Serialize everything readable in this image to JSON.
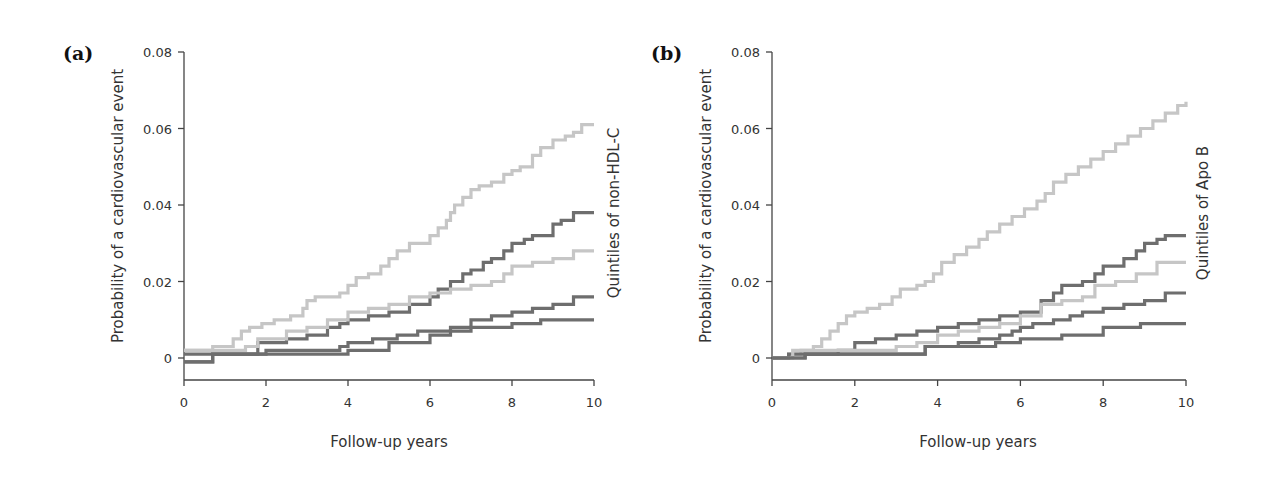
{
  "chart_data": [
    {
      "panel": "(a)",
      "type": "line",
      "step": true,
      "title": "",
      "xlabel": "Follow-up years",
      "ylabel": "Probability of a cardiovascular event",
      "legend_label": "Quintiles of non-HDL-C",
      "xlim": [
        0,
        10
      ],
      "ylim": [
        0,
        0.08
      ],
      "xticks": [
        "0",
        "2",
        "4",
        "6",
        "8",
        "10"
      ],
      "yticks": [
        "0",
        "0.02",
        "0.04",
        "0.06",
        "0.08"
      ],
      "grid": false,
      "series": [
        {
          "name": "Quintile 5 (highest)",
          "color": "#c6c6c6",
          "x": [
            0,
            0.7,
            1.2,
            1.4,
            1.6,
            1.9,
            2.2,
            2.6,
            2.9,
            3.0,
            3.2,
            3.5,
            3.8,
            4.0,
            4.2,
            4.5,
            4.8,
            5.0,
            5.2,
            5.5,
            5.8,
            6.0,
            6.2,
            6.4,
            6.5,
            6.6,
            6.8,
            7.0,
            7.2,
            7.5,
            7.8,
            8.0,
            8.2,
            8.5,
            8.7,
            9.0,
            9.3,
            9.5,
            9.7,
            10
          ],
          "y": [
            0.002,
            0.003,
            0.005,
            0.007,
            0.008,
            0.009,
            0.01,
            0.011,
            0.013,
            0.015,
            0.016,
            0.016,
            0.017,
            0.019,
            0.021,
            0.022,
            0.024,
            0.026,
            0.028,
            0.03,
            0.03,
            0.032,
            0.034,
            0.036,
            0.038,
            0.04,
            0.042,
            0.044,
            0.045,
            0.046,
            0.048,
            0.049,
            0.05,
            0.053,
            0.055,
            0.057,
            0.058,
            0.059,
            0.061,
            0.061
          ]
        },
        {
          "name": "Quintile 4",
          "color": "#6e6e6e",
          "x": [
            0,
            0.7,
            1.8,
            2.5,
            3.0,
            3.5,
            3.8,
            4.0,
            4.5,
            5.0,
            5.5,
            6.0,
            6.2,
            6.5,
            6.8,
            7.0,
            7.3,
            7.5,
            7.8,
            8.0,
            8.3,
            8.5,
            9.0,
            9.2,
            9.5,
            10
          ],
          "y": [
            0.001,
            0.001,
            0.004,
            0.005,
            0.006,
            0.008,
            0.009,
            0.01,
            0.011,
            0.012,
            0.014,
            0.016,
            0.018,
            0.02,
            0.022,
            0.023,
            0.025,
            0.026,
            0.028,
            0.03,
            0.031,
            0.032,
            0.035,
            0.036,
            0.038,
            0.038
          ]
        },
        {
          "name": "Quintile 3",
          "color": "#c6c6c6",
          "x": [
            0,
            1.5,
            1.8,
            2.5,
            3.0,
            3.5,
            4.0,
            4.5,
            5.0,
            5.5,
            6.0,
            6.5,
            7.0,
            7.5,
            7.8,
            8.0,
            8.5,
            9.0,
            9.5,
            10
          ],
          "y": [
            0.002,
            0.003,
            0.005,
            0.007,
            0.008,
            0.01,
            0.012,
            0.013,
            0.014,
            0.016,
            0.017,
            0.018,
            0.019,
            0.02,
            0.022,
            0.024,
            0.025,
            0.026,
            0.028,
            0.028
          ]
        },
        {
          "name": "Quintile 2",
          "color": "#6e6e6e",
          "x": [
            0,
            0.7,
            2.0,
            2.9,
            3.8,
            4.0,
            4.6,
            5.2,
            5.7,
            6.0,
            6.5,
            7.0,
            7.5,
            8.0,
            8.5,
            9.0,
            9.5,
            10
          ],
          "y": [
            -0.001,
            0.001,
            0.002,
            0.002,
            0.003,
            0.004,
            0.005,
            0.006,
            0.007,
            0.007,
            0.008,
            0.01,
            0.011,
            0.012,
            0.013,
            0.014,
            0.016,
            0.016
          ]
        },
        {
          "name": "Quintile 1 (lowest)",
          "color": "#6e6e6e",
          "x": [
            0,
            0.7,
            2.9,
            4.0,
            5.0,
            6.0,
            6.5,
            7.0,
            8.0,
            8.7,
            10
          ],
          "y": [
            -0.001,
            0.001,
            0.001,
            0.002,
            0.004,
            0.006,
            0.007,
            0.008,
            0.009,
            0.01,
            0.01
          ]
        }
      ]
    },
    {
      "panel": "(b)",
      "type": "line",
      "step": true,
      "title": "",
      "xlabel": "Follow-up years",
      "ylabel": "Probability of a cardiovascular event",
      "legend_label": "Quintiles of Apo B",
      "xlim": [
        0,
        10
      ],
      "ylim": [
        0,
        0.08
      ],
      "xticks": [
        "0",
        "2",
        "4",
        "6",
        "8",
        "10"
      ],
      "yticks": [
        "0",
        "0.02",
        "0.04",
        "0.06",
        "0.08"
      ],
      "grid": false,
      "series": [
        {
          "name": "Quintile 5 (highest)",
          "color": "#c6c6c6",
          "x": [
            0,
            0.4,
            0.7,
            1.0,
            1.2,
            1.4,
            1.6,
            1.8,
            2.0,
            2.3,
            2.6,
            2.9,
            3.1,
            3.5,
            3.7,
            3.9,
            4.1,
            4.4,
            4.7,
            5.0,
            5.2,
            5.5,
            5.8,
            6.1,
            6.4,
            6.6,
            6.8,
            7.1,
            7.4,
            7.7,
            8.0,
            8.3,
            8.6,
            8.9,
            9.2,
            9.5,
            9.8,
            10
          ],
          "y": [
            0,
            0.001,
            0.002,
            0.003,
            0.005,
            0.007,
            0.009,
            0.011,
            0.012,
            0.013,
            0.014,
            0.016,
            0.018,
            0.019,
            0.02,
            0.022,
            0.025,
            0.027,
            0.029,
            0.031,
            0.033,
            0.035,
            0.037,
            0.039,
            0.041,
            0.043,
            0.046,
            0.048,
            0.05,
            0.052,
            0.054,
            0.056,
            0.058,
            0.06,
            0.062,
            0.064,
            0.066,
            0.067
          ]
        },
        {
          "name": "Quintile 4",
          "color": "#6e6e6e",
          "x": [
            0,
            0.4,
            0.7,
            1.6,
            2.0,
            2.5,
            3.0,
            3.5,
            4.0,
            4.5,
            5.0,
            5.5,
            6.0,
            6.5,
            6.8,
            7.0,
            7.5,
            7.8,
            8.0,
            8.5,
            8.8,
            9.0,
            9.3,
            9.5,
            10
          ],
          "y": [
            0,
            0.001,
            0.001,
            0.002,
            0.004,
            0.005,
            0.006,
            0.007,
            0.008,
            0.009,
            0.01,
            0.011,
            0.012,
            0.015,
            0.017,
            0.019,
            0.02,
            0.022,
            0.024,
            0.026,
            0.028,
            0.03,
            0.031,
            0.032,
            0.032
          ]
        },
        {
          "name": "Quintile 3",
          "color": "#c6c6c6",
          "x": [
            0,
            0.5,
            1.0,
            2.4,
            3.0,
            3.5,
            4.0,
            4.5,
            5.0,
            5.5,
            6.0,
            6.5,
            7.0,
            7.5,
            7.8,
            8.3,
            8.8,
            9.3,
            10
          ],
          "y": [
            0,
            0.002,
            0.002,
            0.002,
            0.003,
            0.004,
            0.006,
            0.007,
            0.008,
            0.009,
            0.011,
            0.014,
            0.015,
            0.016,
            0.019,
            0.02,
            0.022,
            0.025,
            0.025
          ]
        },
        {
          "name": "Quintile 2",
          "color": "#6e6e6e",
          "x": [
            0,
            0.8,
            3.7,
            4.5,
            5.0,
            5.5,
            5.8,
            6.0,
            6.3,
            6.8,
            7.2,
            7.5,
            8.0,
            8.5,
            9.0,
            9.5,
            10
          ],
          "y": [
            0,
            0.001,
            0.003,
            0.004,
            0.005,
            0.006,
            0.007,
            0.008,
            0.009,
            0.01,
            0.011,
            0.012,
            0.013,
            0.014,
            0.015,
            0.017,
            0.017
          ]
        },
        {
          "name": "Quintile 1 (lowest)",
          "color": "#6e6e6e",
          "x": [
            0,
            0.8,
            2.4,
            3.7,
            5.4,
            6.0,
            7.0,
            8.0,
            8.9,
            10
          ],
          "y": [
            0,
            0.001,
            0.001,
            0.003,
            0.004,
            0.005,
            0.006,
            0.008,
            0.009,
            0.009
          ]
        }
      ]
    }
  ],
  "layout": [
    {
      "x0": 184,
      "x10": 594,
      "y0": 358,
      "y008": 52,
      "axisY": 380,
      "axisTop": 52,
      "labelX": 63,
      "labelY": 58,
      "legendX": 614,
      "legendY": 214
    },
    {
      "x0": 772,
      "x10": 1186,
      "y0": 358,
      "y008": 52,
      "axisY": 380,
      "axisTop": 52,
      "labelX": 651,
      "labelY": 58,
      "legendX": 1203,
      "legendY": 214
    }
  ]
}
